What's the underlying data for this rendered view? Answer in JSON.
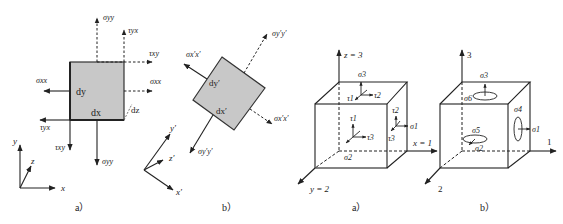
{
  "figure_left": {
    "panel_a": {
      "caption": "a）",
      "element_labels": {
        "dx": "dx",
        "dy": "dy",
        "dz": "dz"
      },
      "stress_labels": {
        "sigma_yy_top": "σyy",
        "tau_yx_top": "τyx",
        "tau_xy_right": "τxy",
        "sigma_xx_right": "σxx",
        "sigma_xx_left": "σxx",
        "tau_yx_bottom": "τyx",
        "tau_xy_bottom": "τxy",
        "sigma_yy_bottom": "σyy"
      },
      "axes": {
        "x": "x",
        "y": "y",
        "z": "z"
      }
    },
    "panel_b": {
      "caption": "b）",
      "element_labels": {
        "dx": "dx′",
        "dy": "dy′"
      },
      "stress_labels": {
        "sigma_yy_prime_top": "σy′y′",
        "sigma_xx_prime_left": "σx′x′",
        "sigma_xx_prime_right": "σx′x′",
        "sigma_yy_prime_bottom": "σy′y′"
      },
      "axes": {
        "x": "x′",
        "y": "y′",
        "z": "z′"
      }
    }
  },
  "figure_right": {
    "panel_a": {
      "caption": "a）",
      "axes": {
        "z": "z = 3",
        "x": "x = 1",
        "y": "y = 2"
      },
      "labels": {
        "sigma3": "σ3",
        "sigma1": "σ1",
        "sigma2": "σ2",
        "top_tau1": "τ1",
        "top_tau2": "τ2",
        "front_tau1": "τ1",
        "front_tau3": "τ3",
        "side_tau2": "τ2",
        "side_tau3": "τ3"
      }
    },
    "panel_b": {
      "caption": "b）",
      "axes": {
        "3": "3",
        "1": "1",
        "2": "2"
      },
      "labels": {
        "sigma3": "σ3",
        "sigma6": "σ6",
        "sigma4": "σ4",
        "sigma1": "σ1",
        "sigma5": "σ5",
        "sigma2": "σ2"
      }
    }
  },
  "colors": {
    "element_fill": "#c8c8c8",
    "stroke": "#222222"
  }
}
